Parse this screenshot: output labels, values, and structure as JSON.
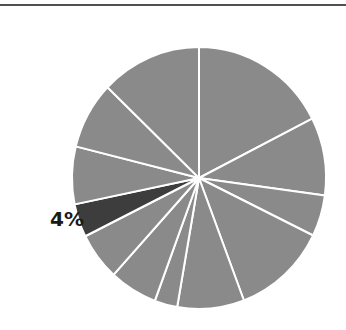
{
  "chart_data": {
    "type": "pie",
    "title": "",
    "start_angle_deg": 0,
    "direction": "clockwise",
    "slices": [
      {
        "value": 17.5,
        "color": "#8a8a8a",
        "highlight": false
      },
      {
        "value": 9.6,
        "color": "#8a8a8a",
        "highlight": false
      },
      {
        "value": 5.1,
        "color": "#8a8a8a",
        "highlight": false
      },
      {
        "value": 12.0,
        "color": "#8a8a8a",
        "highlight": false
      },
      {
        "value": 8.5,
        "color": "#8a8a8a",
        "highlight": false
      },
      {
        "value": 2.9,
        "color": "#8a8a8a",
        "highlight": false
      },
      {
        "value": 6.1,
        "color": "#8a8a8a",
        "highlight": false
      },
      {
        "value": 5.9,
        "color": "#8a8a8a",
        "highlight": false
      },
      {
        "value": 4.1,
        "color": "#3d3d3d",
        "highlight": true,
        "label": "4%"
      },
      {
        "value": 7.1,
        "color": "#8a8a8a",
        "highlight": false
      },
      {
        "value": 8.3,
        "color": "#8a8a8a",
        "highlight": false
      },
      {
        "value": 12.8,
        "color": "#8a8a8a",
        "highlight": false
      }
    ],
    "annotations": [
      "4%"
    ],
    "legend": null
  },
  "labels": {
    "highlight_label": "4%"
  },
  "colors": {
    "slice": "#8a8a8a",
    "highlight": "#3d3d3d",
    "divider": "#ffffff",
    "rule": "#505050"
  }
}
